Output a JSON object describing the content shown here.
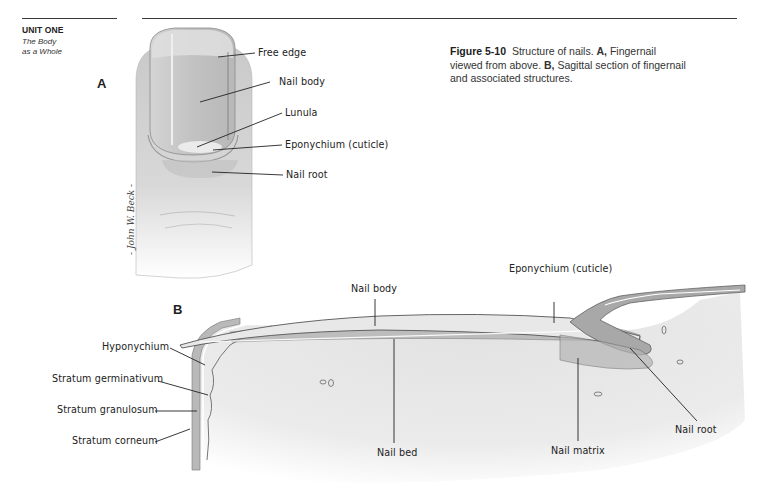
{
  "header": {
    "unit_title": "UNIT ONE",
    "unit_subtitle_line1": "The Body",
    "unit_subtitle_line2": "as a Whole"
  },
  "caption": {
    "figure_number": "Figure 5-10",
    "text_part1": "Structure of nails.",
    "marker_a": "A,",
    "text_part2": "Fingernail viewed from above.",
    "marker_b": "B,",
    "text_part3": "Sagittal section of fingernail and associated structures."
  },
  "panel_a": {
    "label": "A",
    "signature": "- John W. Beck -",
    "labels": [
      {
        "text": "Free edge"
      },
      {
        "text": "Nail body"
      },
      {
        "text": "Lunula"
      },
      {
        "text": "Eponychium (cuticle)"
      },
      {
        "text": "Nail root"
      }
    ]
  },
  "panel_b": {
    "label": "B",
    "labels": [
      {
        "text": "Nail body"
      },
      {
        "text": "Eponychium (cuticle)"
      },
      {
        "text": "Hyponychium"
      },
      {
        "text": "Stratum germinativum"
      },
      {
        "text": "Stratum granulosum"
      },
      {
        "text": "Stratum corneum"
      },
      {
        "text": "Nail bed"
      },
      {
        "text": "Nail matrix"
      },
      {
        "text": "Nail root"
      }
    ]
  },
  "colors": {
    "ink": "#222222",
    "skin": "#d3d3d3",
    "nail": "#e6e6e6",
    "dermis": "#e9e9e9"
  }
}
